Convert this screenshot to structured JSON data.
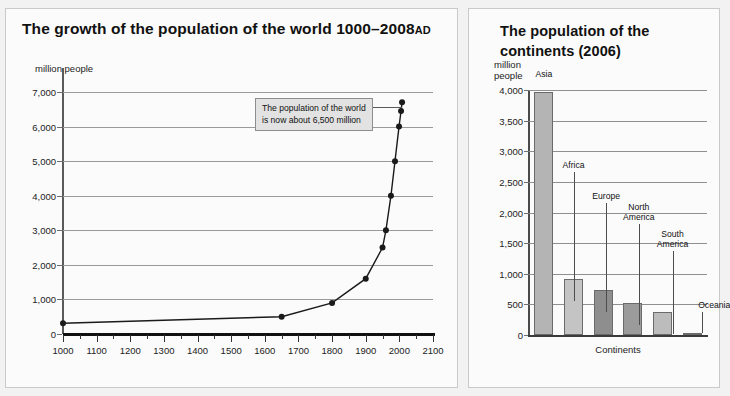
{
  "page": {
    "background_color": "#f2f2f2",
    "panel_color": "#fbfbfb"
  },
  "left_panel": {
    "title_main": "The growth of the population of the world 1000–2008",
    "title_suffix": "AD",
    "y_unit_label": "million people",
    "callout_line1": "The population of the world",
    "callout_line2": "is now about 6,500 million"
  },
  "right_panel": {
    "title": "The population of the continents (2006)",
    "y_unit_line1": "million",
    "y_unit_line2": "people",
    "x_axis_title": "Continents"
  },
  "chart_data": [
    {
      "type": "line",
      "title": "The growth of the population of the world 1000–2008 AD",
      "xlabel": "",
      "ylabel": "million people",
      "xlim": [
        1000,
        2100
      ],
      "ylim": [
        0,
        7000
      ],
      "grid": true,
      "y_ticks": [
        0,
        1000,
        2000,
        3000,
        4000,
        5000,
        6000,
        7000
      ],
      "y_tick_labels": [
        "0",
        "1,000",
        "2,000",
        "3,000",
        "4,000",
        "5,000",
        "6,000",
        "7,000"
      ],
      "x_ticks": [
        1000,
        1100,
        1200,
        1300,
        1400,
        1500,
        1600,
        1700,
        1800,
        1900,
        2000,
        2100
      ],
      "x_tick_labels": [
        "1000",
        "1100",
        "1200",
        "1300",
        "1400",
        "1500",
        "1600",
        "1700",
        "1800",
        "1900",
        "2000",
        "2100"
      ],
      "x_minor_step": 50,
      "annotation": "The population of the world is now about 6,500 million",
      "series": [
        {
          "name": "World population",
          "marker": "circle",
          "color": "#1a1a1a",
          "points": [
            {
              "x": 1000,
              "y": 310
            },
            {
              "x": 1650,
              "y": 500
            },
            {
              "x": 1800,
              "y": 900
            },
            {
              "x": 1900,
              "y": 1600
            },
            {
              "x": 1950,
              "y": 2500
            },
            {
              "x": 1960,
              "y": 3000
            },
            {
              "x": 1975,
              "y": 4000
            },
            {
              "x": 1987,
              "y": 5000
            },
            {
              "x": 1999,
              "y": 6000
            },
            {
              "x": 2005,
              "y": 6450
            },
            {
              "x": 2008,
              "y": 6700
            }
          ]
        }
      ]
    },
    {
      "type": "bar",
      "title": "The population of the continents (2006)",
      "xlabel": "Continents",
      "ylabel": "million people",
      "ylim": [
        0,
        4000
      ],
      "grid": true,
      "y_ticks": [
        0,
        500,
        1000,
        1500,
        2000,
        2500,
        3000,
        3500,
        4000
      ],
      "y_tick_labels": [
        "0",
        "500",
        "1,000",
        "1,500",
        "2,000",
        "2,500",
        "3,000",
        "3,500",
        "4,000"
      ],
      "categories": [
        "Asia",
        "Africa",
        "Europe",
        "North America",
        "South America",
        "Oceania"
      ],
      "values": [
        3970,
        920,
        730,
        520,
        380,
        35
      ],
      "bar_colors": [
        "#b4b4b4",
        "#c4c4c4",
        "#8e8e8e",
        "#9b9b9b",
        "#bcbcbc",
        "#a8a8a8"
      ]
    }
  ]
}
